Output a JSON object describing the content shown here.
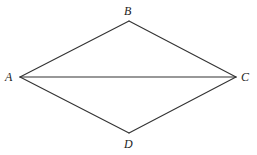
{
  "diagram": {
    "type": "geometry",
    "shape": "quadrilateral (rhombus-like) ABCD with diagonal AC",
    "stroke_color": "#333333",
    "vertices": [
      {
        "id": "A",
        "label": "A",
        "x": 20,
        "y": 77,
        "label_x": 5,
        "label_y": 81
      },
      {
        "id": "B",
        "label": "B",
        "x": 129,
        "y": 21,
        "label_x": 124,
        "label_y": 15
      },
      {
        "id": "C",
        "label": "C",
        "x": 236,
        "y": 77,
        "label_x": 241,
        "label_y": 81
      },
      {
        "id": "D",
        "label": "D",
        "x": 129,
        "y": 133,
        "label_x": 124,
        "label_y": 148
      }
    ],
    "edges": [
      {
        "from": "A",
        "to": "B"
      },
      {
        "from": "B",
        "to": "C"
      },
      {
        "from": "C",
        "to": "D"
      },
      {
        "from": "D",
        "to": "A"
      },
      {
        "from": "A",
        "to": "C"
      }
    ]
  }
}
